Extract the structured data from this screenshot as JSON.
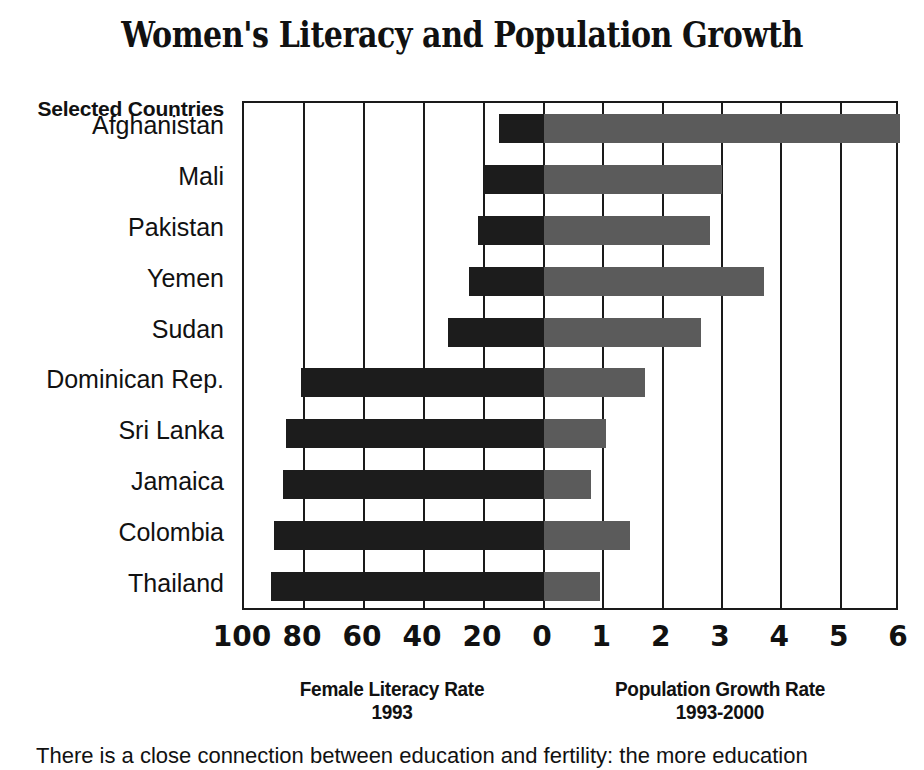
{
  "title": "Women's Literacy and Population Growth",
  "row_header": "Selected Countries",
  "caption": "There is a close connection between education and fertility: the more education",
  "colors": {
    "literacy_bar": "#1c1c1c",
    "growth_bar": "#5b5b5b",
    "frame": "#1a1a1a",
    "background": "#ffffff"
  },
  "axes": {
    "left": {
      "title": "Female Literacy Rate",
      "subtitle": "1993",
      "ticks": [
        "100",
        "80",
        "60",
        "40",
        "20",
        "0"
      ]
    },
    "right": {
      "title": "Population Growth Rate",
      "subtitle": "1993-2000",
      "ticks": [
        "0",
        "1",
        "2",
        "3",
        "4",
        "5",
        "6"
      ]
    }
  },
  "chart_data": {
    "type": "bar",
    "title": "Women's Literacy and Population Growth",
    "subtype": "diverging-horizontal-bidirectional-axis",
    "categories": [
      "Afghanistan",
      "Mali",
      "Pakistan",
      "Yemen",
      "Sudan",
      "Dominican Rep.",
      "Sri Lanka",
      "Jamaica",
      "Colombia",
      "Thailand"
    ],
    "series": [
      {
        "name": "Female Literacy Rate 1993",
        "direction": "left",
        "unit": "percent",
        "color": "#1c1c1c",
        "axis_range": [
          0,
          100
        ],
        "axis_ticks": [
          100,
          80,
          60,
          40,
          20,
          0
        ],
        "values": [
          15,
          20,
          22,
          25,
          32,
          81,
          86,
          87,
          90,
          91
        ]
      },
      {
        "name": "Population Growth Rate 1993-2000",
        "direction": "right",
        "unit": "percent per year",
        "color": "#5b5b5b",
        "axis_range": [
          0,
          6
        ],
        "axis_ticks": [
          0,
          1,
          2,
          3,
          4,
          5,
          6
        ],
        "values": [
          6.0,
          3.0,
          2.8,
          3.7,
          2.65,
          1.7,
          1.05,
          0.8,
          1.45,
          0.95
        ]
      }
    ],
    "xlabel": "",
    "ylabel": "Selected Countries",
    "grid": true,
    "legend": "none",
    "annotations": []
  }
}
